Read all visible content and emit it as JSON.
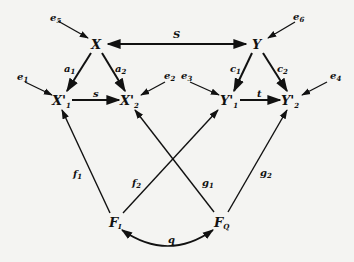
{
  "diagram": {
    "type": "path-diagram",
    "nodes": {
      "X": {
        "label": "X",
        "x": 97,
        "y": 44
      },
      "Y": {
        "label": "Y",
        "x": 258,
        "y": 44
      },
      "X1": {
        "label": "X'",
        "sub": "1",
        "x": 63,
        "y": 100
      },
      "X2": {
        "label": "X'",
        "sub": "2",
        "x": 130,
        "y": 100
      },
      "Y1": {
        "label": "Y'",
        "sub": "1",
        "x": 230,
        "y": 100
      },
      "Y2": {
        "label": "Y'",
        "sub": "2",
        "x": 292,
        "y": 100
      },
      "FI": {
        "label": "F",
        "sub": "I",
        "x": 116,
        "y": 222
      },
      "FQ": {
        "label": "F",
        "sub": "Q",
        "x": 222,
        "y": 222
      }
    },
    "errors": {
      "e5": {
        "label": "e",
        "sub": "5",
        "target": "X"
      },
      "e6": {
        "label": "e",
        "sub": "6",
        "target": "Y"
      },
      "e1": {
        "label": "e",
        "sub": "1",
        "target": "X1"
      },
      "e2": {
        "label": "e",
        "sub": "2",
        "target": "X2"
      },
      "e3": {
        "label": "e",
        "sub": "3",
        "target": "Y1"
      },
      "e4": {
        "label": "e",
        "sub": "4",
        "target": "Y2"
      }
    },
    "edges": [
      {
        "from": "X",
        "to": "Y",
        "label": "S",
        "sub": "",
        "bidirectional": true
      },
      {
        "from": "X",
        "to": "X1",
        "label": "a",
        "sub": "1"
      },
      {
        "from": "X",
        "to": "X2",
        "label": "a",
        "sub": "2"
      },
      {
        "from": "X1",
        "to": "X2",
        "label": "s",
        "sub": ""
      },
      {
        "from": "Y",
        "to": "Y1",
        "label": "c",
        "sub": "1"
      },
      {
        "from": "Y",
        "to": "Y2",
        "label": "c",
        "sub": "2"
      },
      {
        "from": "Y1",
        "to": "Y2",
        "label": "t",
        "sub": ""
      },
      {
        "from": "FI",
        "to": "X1",
        "label": "f",
        "sub": "1"
      },
      {
        "from": "FI",
        "to": "Y1",
        "label": "f",
        "sub": "2"
      },
      {
        "from": "FQ",
        "to": "X2",
        "label": "g",
        "sub": "1"
      },
      {
        "from": "FQ",
        "to": "Y2",
        "label": "g",
        "sub": "2"
      },
      {
        "from": "FI",
        "to": "FQ",
        "label": "q",
        "sub": "",
        "curved": true,
        "bidirectional": true
      }
    ]
  }
}
